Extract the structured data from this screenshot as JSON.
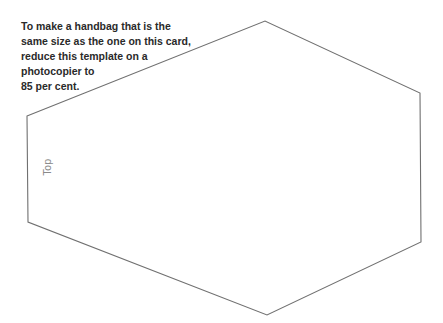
{
  "instructions": {
    "lines": [
      "To make a handbag that is the",
      "same size as the one on this card,",
      "reduce this template on a",
      "photocopier to",
      "85 per cent."
    ]
  },
  "template": {
    "shape": "hexagon",
    "stroke_color": "#707070",
    "label": "Top"
  }
}
